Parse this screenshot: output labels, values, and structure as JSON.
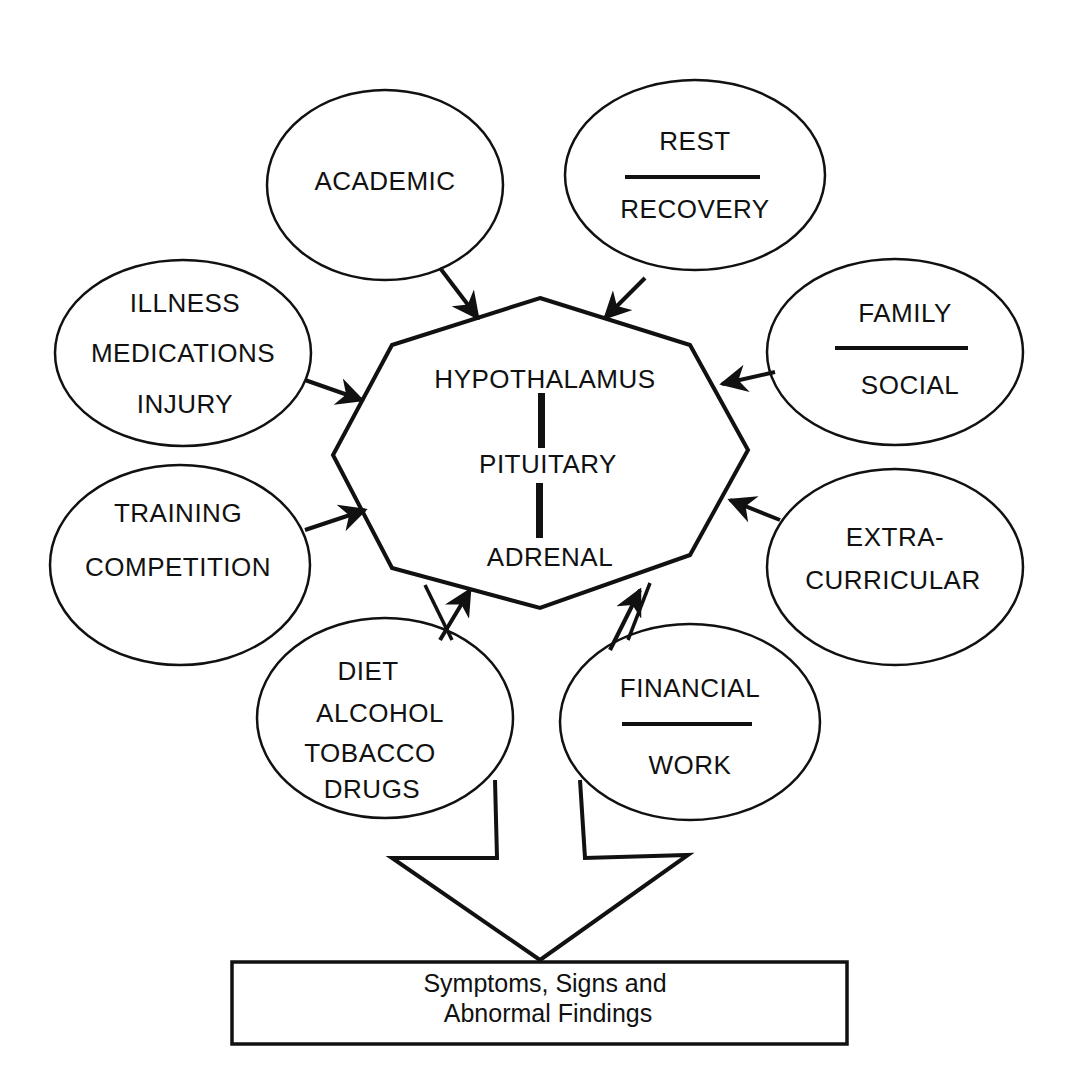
{
  "center": {
    "lines": [
      "HYPOTHALAMUS",
      "PITUITARY",
      "ADRENAL"
    ]
  },
  "factors": [
    {
      "id": "academic",
      "lines": [
        "ACADEMIC"
      ],
      "divider": false
    },
    {
      "id": "rest-recovery",
      "lines": [
        "REST",
        "RECOVERY"
      ],
      "divider": true
    },
    {
      "id": "family-social",
      "lines": [
        "FAMILY",
        "SOCIAL"
      ],
      "divider": true
    },
    {
      "id": "extracurricular",
      "lines": [
        "EXTRA-",
        "CURRICULAR"
      ],
      "divider": false
    },
    {
      "id": "financial-work",
      "lines": [
        "FINANCIAL",
        "WORK"
      ],
      "divider": true
    },
    {
      "id": "diet",
      "lines": [
        "DIET",
        "ALCOHOL",
        "TOBACCO",
        "DRUGS"
      ],
      "divider": false
    },
    {
      "id": "training",
      "lines": [
        "TRAINING",
        "COMPETITION"
      ],
      "divider": false
    },
    {
      "id": "illness",
      "lines": [
        "ILLNESS",
        "MEDICATIONS",
        "INJURY"
      ],
      "divider": false
    }
  ],
  "outcome": {
    "lines": [
      "Symptoms, Signs  and",
      "Abnormal Findings"
    ]
  },
  "colors": {
    "stroke": "#111111",
    "background": "#ffffff"
  }
}
